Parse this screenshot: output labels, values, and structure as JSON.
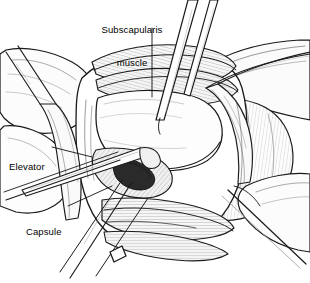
{
  "figure": {
    "type": "medical-surgical-illustration",
    "style": "black-and-white pen-and-ink line drawing with cross-hatch shading",
    "background_color": "#ffffff",
    "line_color": "#1a1a1a",
    "fill_light": "#f2f2f2",
    "fill_mid": "#d9d9d9",
    "fill_dark": "#2b2b2b",
    "width": 310,
    "height": 283
  },
  "labels": [
    {
      "id": "subscapularis",
      "text_line1": "Subscapularis",
      "text_line2": "muscle",
      "x": 86,
      "y": 2,
      "align": "center",
      "leader": {
        "x1": 152,
        "y1": 28,
        "x2": 152,
        "y2": 97
      }
    },
    {
      "id": "elevator",
      "text_line1": "Elevator",
      "text_line2": "",
      "x": 9,
      "y": 139,
      "align": "left",
      "leader": {
        "x1": 52,
        "y1": 147,
        "x2": 92,
        "y2": 156
      }
    },
    {
      "id": "capsule",
      "text_line1": "Capsule",
      "text_line2": "",
      "x": 26,
      "y": 204,
      "align": "left",
      "leader": {
        "x1": 68,
        "y1": 206,
        "x2": 110,
        "y2": 186
      }
    }
  ],
  "anatomy": [
    {
      "id": "subscapularis-band",
      "name": "Subscapularis muscle band",
      "shading": "hatched"
    },
    {
      "id": "humeral-head",
      "name": "Humeral head",
      "shading": "smooth"
    },
    {
      "id": "capsule-flap",
      "name": "Joint capsule flap",
      "shading": "hatched"
    },
    {
      "id": "inferior-tissue-band",
      "name": "Inferior soft-tissue band",
      "shading": "hatched"
    },
    {
      "id": "deltoid-right",
      "name": "Right soft tissue / deltoid",
      "shading": "stippled"
    },
    {
      "id": "incision-pocket",
      "name": "Incision pocket",
      "shading": "dark"
    }
  ],
  "instruments": [
    {
      "id": "retractor-left",
      "name": "Left retractor blade"
    },
    {
      "id": "retractor-right",
      "name": "Right retractor blade"
    },
    {
      "id": "retractor-bottom-right",
      "name": "Lower right retractor"
    },
    {
      "id": "forceps-upper",
      "name": "Upper instrument shaft"
    },
    {
      "id": "forceps-upper-2",
      "name": "Second upper instrument shaft"
    },
    {
      "id": "elevator-instrument",
      "name": "Elevator"
    },
    {
      "id": "shaft-lower-left",
      "name": "Lower left instrument shaft"
    }
  ]
}
